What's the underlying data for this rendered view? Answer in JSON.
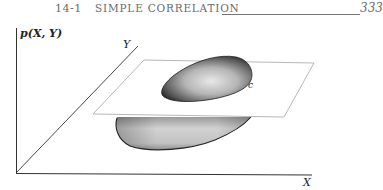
{
  "header": {
    "section_number": "14-1",
    "section_title": "SIMPLE CORRELATION",
    "page_number": "333"
  },
  "figure": {
    "vertical_axis_label": "p(X, Y)",
    "depth_axis_label": "Y",
    "horizontal_axis_label": "X",
    "contour_label": "c",
    "colors": {
      "axis": "#333333",
      "plane_fill": "#ffffff",
      "plane_edge": "#b8b8b8",
      "surface_dark": "#2a2a2a",
      "surface_light": "#e6e6e6"
    }
  }
}
